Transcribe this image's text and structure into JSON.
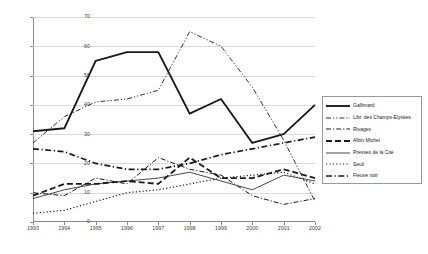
{
  "chart_data": {
    "type": "line",
    "title": "",
    "xlabel": "",
    "ylabel": "",
    "x": [
      1993,
      1994,
      1995,
      1996,
      1997,
      1998,
      1999,
      2000,
      2001,
      2002
    ],
    "xtick_labels": [
      "1993",
      "1994",
      "1995",
      "1996",
      "1997",
      "1998",
      "1999",
      "2000",
      "2001",
      "2002"
    ],
    "ytick_labels": [
      "0",
      "10",
      "20",
      "30",
      "40",
      "50",
      "60",
      "70"
    ],
    "yticks": [
      0,
      10,
      20,
      30,
      40,
      50,
      60,
      70
    ],
    "ylim": [
      0,
      70
    ],
    "xlim": [
      1993,
      2002
    ],
    "grid": "horizontal",
    "legend_position": "right",
    "series": [
      {
        "name": "Gallimard",
        "style": "solid-thick",
        "color": "#1a1a1a",
        "values": [
          31,
          32,
          55,
          58,
          58,
          37,
          42,
          27,
          30,
          40
        ]
      },
      {
        "name": "Libr. des Champs-Elysées",
        "style": "dash-dot-dot",
        "color": "#1a1a1a",
        "values": [
          27,
          36,
          41,
          42,
          45,
          65,
          60,
          46,
          28,
          7
        ]
      },
      {
        "name": "Rivages",
        "style": "dash-dot",
        "color": "#1a1a1a",
        "values": [
          10,
          9,
          15,
          13,
          22,
          18,
          16,
          9,
          6,
          8
        ]
      },
      {
        "name": "Albin Michel",
        "style": "dashed-thick",
        "color": "#1a1a1a",
        "values": [
          9,
          13,
          13,
          14,
          13,
          22,
          15,
          15,
          18,
          15
        ]
      },
      {
        "name": "Presses de la Cité",
        "style": "solid-thin",
        "color": "#1a1a1a",
        "values": [
          8,
          11,
          13,
          14,
          15,
          17,
          14,
          11,
          16,
          14
        ]
      },
      {
        "name": "Seuil",
        "style": "dotted",
        "color": "#1a1a1a",
        "values": [
          3,
          4,
          7,
          10,
          11,
          13,
          15,
          16,
          17,
          13
        ]
      },
      {
        "name": "Fleuve noir",
        "style": "dash-dot-thick",
        "color": "#1a1a1a",
        "values": [
          25,
          24,
          20,
          18,
          18,
          20,
          23,
          25,
          27,
          29
        ]
      }
    ]
  },
  "legend": {
    "items": [
      {
        "label": "Gallimard"
      },
      {
        "label": "Libr. des Champs-Elysées"
      },
      {
        "label": "Rivages"
      },
      {
        "label": "Albin Michel"
      },
      {
        "label": "Presses de la Cité"
      },
      {
        "label": "Seuil"
      },
      {
        "label": "Fleuve noir"
      }
    ]
  }
}
